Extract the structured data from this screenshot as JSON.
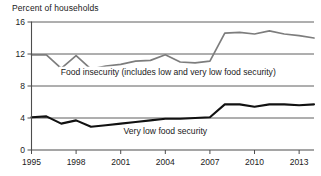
{
  "chart_data": {
    "type": "line",
    "title": "Percent of households",
    "xlabel": "",
    "ylabel": "Percent of households",
    "xlim": [
      1995,
      2014
    ],
    "ylim": [
      0,
      16
    ],
    "yticks": [
      0,
      4,
      8,
      12,
      16
    ],
    "ytick_labels": [
      "0",
      "4",
      "8",
      "12",
      "16"
    ],
    "xticks": [
      1995,
      1998,
      2001,
      2004,
      2007,
      2010,
      2013
    ],
    "xtick_labels": [
      "1995",
      "1998",
      "2001",
      "2004",
      "2007",
      "2010",
      "2013"
    ],
    "grid": true,
    "grid_axis": "y",
    "legend": "inline-annotations",
    "x": [
      1995,
      1996,
      1997,
      1998,
      1999,
      2000,
      2001,
      2002,
      2003,
      2004,
      2005,
      2006,
      2007,
      2008,
      2009,
      2010,
      2011,
      2012,
      2013,
      2014
    ],
    "series": [
      {
        "name": "Food insecurity (includes low and very low food security)",
        "color": "#7d7d7d",
        "values": [
          11.9,
          11.9,
          10.2,
          11.8,
          10.1,
          10.5,
          10.7,
          11.1,
          11.2,
          11.9,
          11.0,
          10.9,
          11.1,
          14.6,
          14.7,
          14.5,
          14.9,
          14.5,
          14.3,
          14.0
        ]
      },
      {
        "name": "Very low food security",
        "color": "#111111",
        "values": [
          4.1,
          4.2,
          3.3,
          3.7,
          2.9,
          3.1,
          3.3,
          3.5,
          3.7,
          3.9,
          3.9,
          4.0,
          4.1,
          5.7,
          5.7,
          5.4,
          5.7,
          5.7,
          5.6,
          5.7
        ]
      }
    ],
    "annotations": [
      {
        "text": "Food insecurity (includes low and very low food security)",
        "x": 2004.2,
        "y": 9.35,
        "series": "Food insecurity (includes low and very low food security)"
      },
      {
        "text": "Very low food security",
        "x": 2004.0,
        "y": 1.95,
        "series": "Very low food security"
      }
    ]
  },
  "figure": {
    "axis_title": "Percent of households"
  }
}
